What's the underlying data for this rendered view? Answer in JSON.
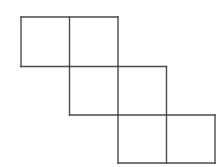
{
  "figure": {
    "background_color": "#ffffff",
    "line_color": "#4a4a4a",
    "line_width": 1.4,
    "cell_size": 48.5,
    "origin": {
      "x": 21,
      "y": 17
    },
    "rows": [
      {
        "name": "top-row",
        "row_index": 0,
        "column_start": 0,
        "cells": [
          {
            "name": "cell-r0c0",
            "col": 0
          },
          {
            "name": "cell-r0c1",
            "col": 1
          }
        ]
      },
      {
        "name": "middle-row",
        "row_index": 1,
        "column_start": 1,
        "cells": [
          {
            "name": "cell-r1c1",
            "col": 1
          },
          {
            "name": "cell-r1c2",
            "col": 2
          }
        ]
      },
      {
        "name": "bottom-row",
        "row_index": 2,
        "column_start": 2,
        "cells": [
          {
            "name": "cell-r2c2",
            "col": 2
          },
          {
            "name": "cell-r2c3",
            "col": 3
          }
        ]
      }
    ],
    "squares": [
      {
        "id": "r0c0",
        "x": 21,
        "y": 17,
        "w": 48.5,
        "h": 49.5
      },
      {
        "id": "r0c1",
        "x": 69.5,
        "y": 17,
        "w": 48.5,
        "h": 49.5
      },
      {
        "id": "r1c1",
        "x": 69.5,
        "y": 66.5,
        "w": 48.5,
        "h": 48.5
      },
      {
        "id": "r1c2",
        "x": 118,
        "y": 66.5,
        "w": 48.5,
        "h": 48.5
      },
      {
        "id": "r2c2",
        "x": 118,
        "y": 115,
        "w": 48.5,
        "h": 48
      },
      {
        "id": "r2c3",
        "x": 166.5,
        "y": 115,
        "w": 48.5,
        "h": 48
      }
    ],
    "segments": [
      {
        "name": "top-row-top-edge",
        "x1": 21,
        "y1": 17,
        "x2": 118,
        "y2": 17
      },
      {
        "name": "top-row-left-edge",
        "x1": 21,
        "y1": 17,
        "x2": 21,
        "y2": 66.5
      },
      {
        "name": "top-row-divider",
        "x1": 69.5,
        "y1": 17,
        "x2": 69.5,
        "y2": 66.5
      },
      {
        "name": "top-row-right-edge",
        "x1": 118,
        "y1": 17,
        "x2": 118,
        "y2": 66.5
      },
      {
        "name": "top-row-bottom-edge",
        "x1": 21,
        "y1": 66.5,
        "x2": 166.5,
        "y2": 66.5
      },
      {
        "name": "middle-row-left-edge",
        "x1": 69.5,
        "y1": 66.5,
        "x2": 69.5,
        "y2": 115
      },
      {
        "name": "middle-row-divider",
        "x1": 118,
        "y1": 66.5,
        "x2": 118,
        "y2": 115
      },
      {
        "name": "middle-row-right-edge",
        "x1": 166.5,
        "y1": 66.5,
        "x2": 166.5,
        "y2": 115
      },
      {
        "name": "middle-row-bottom-edge",
        "x1": 69.5,
        "y1": 115,
        "x2": 215,
        "y2": 115
      },
      {
        "name": "bottom-row-left-edge",
        "x1": 118,
        "y1": 115,
        "x2": 118,
        "y2": 163
      },
      {
        "name": "bottom-row-divider",
        "x1": 166.5,
        "y1": 115,
        "x2": 166.5,
        "y2": 163
      },
      {
        "name": "bottom-row-right-edge",
        "x1": 215,
        "y1": 115,
        "x2": 215,
        "y2": 163
      },
      {
        "name": "bottom-row-bottom-edge",
        "x1": 118,
        "y1": 163,
        "x2": 215,
        "y2": 163
      }
    ]
  }
}
